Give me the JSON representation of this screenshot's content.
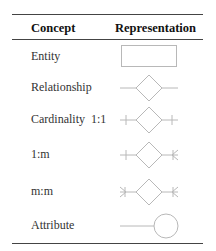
{
  "table": {
    "headers": {
      "concept": "Concept",
      "representation": "Representation"
    },
    "rows": [
      {
        "concept": "Entity",
        "representation": "rectangle"
      },
      {
        "concept": "Relationship",
        "representation": "diamond-with-lines"
      },
      {
        "concept": "Cardinality  1:1",
        "representation": "diamond-bar-bar"
      },
      {
        "concept": "1:m",
        "representation": "diamond-bar-crowsfoot"
      },
      {
        "concept": "m:m",
        "representation": "diamond-crowsfoot-crowsfoot"
      },
      {
        "concept": "Attribute",
        "representation": "line-circle"
      }
    ]
  },
  "colors": {
    "symbol_stroke": "#b8b8b8",
    "rule": "#444444",
    "text": "#333333"
  }
}
